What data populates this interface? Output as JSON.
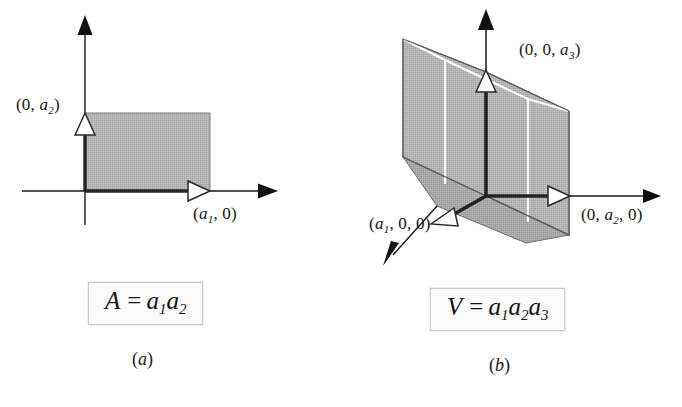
{
  "figure": {
    "kind": "textbook-geometry-figure",
    "background_color": "#ffffff",
    "ink_color": "#1a1a1a",
    "fill_gray": "#b2b2b2",
    "fill_gray_dark": "#9a9a9a",
    "highlight_white": "#ffffff"
  },
  "panel_a": {
    "caption": "(a)",
    "caption_letter": "a",
    "formula": {
      "lhs": "A",
      "equals": "=",
      "term1_var": "a",
      "term1_sub": "1",
      "term2_var": "a",
      "term2_sub": "2",
      "plain": "A = a1a2"
    },
    "labels": {
      "y_point_open": "(0, ",
      "y_point_var": "a",
      "y_point_sub": "2",
      "y_point_close": ")",
      "y_point_plain": "(0, a2)",
      "x_point_open": "(",
      "x_point_var": "a",
      "x_point_sub": "1",
      "x_point_close": ", 0)",
      "x_point_plain": "(a1, 0)"
    },
    "geometry": {
      "origin_x": 85,
      "origin_y": 191,
      "rect_width": 125,
      "rect_height": 78,
      "x_axis_end": 265,
      "y_axis_end": 22
    }
  },
  "panel_b": {
    "caption": "(b)",
    "caption_letter": "b",
    "formula": {
      "lhs": "V",
      "equals": "=",
      "term1_var": "a",
      "term1_sub": "1",
      "term2_var": "a",
      "term2_sub": "2",
      "term3_var": "a",
      "term3_sub": "3",
      "plain": "V = a1a2a3"
    },
    "labels": {
      "z_point_open": "(0, 0, ",
      "z_point_var": "a",
      "z_point_sub": "3",
      "z_point_close": ")",
      "z_point_plain": "(0, 0, a3)",
      "x_point_open": "(",
      "x_point_var": "a",
      "x_point_sub": "1",
      "x_point_close": ", 0, 0)",
      "x_point_plain": "(a1, 0, 0)",
      "y_point_open": "(0, ",
      "y_point_var": "a",
      "y_point_sub": "2",
      "y_point_close": ", 0)",
      "y_point_plain": "(0, a2, 0)"
    },
    "geometry": {
      "origin_x": 145,
      "origin_y": 196,
      "z_top": 72,
      "y_end": 220,
      "x_end": 62,
      "z_axis_tip": 12
    }
  }
}
